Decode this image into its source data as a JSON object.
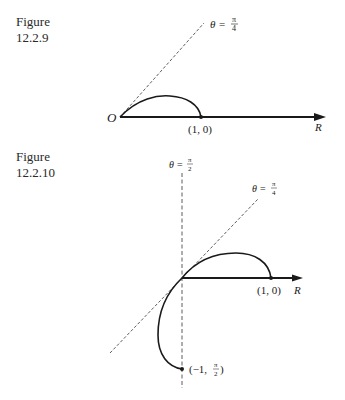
{
  "figures": [
    {
      "caption_word": "Figure",
      "caption_number": "12.2.9",
      "origin_label": "O",
      "axis_label": "R",
      "point_label": "(1, 0)",
      "ray_label": {
        "theta": "θ",
        "eq": "=",
        "num": "π",
        "den": "4"
      }
    },
    {
      "caption_word": "Figure",
      "caption_number": "12.2.10",
      "axis_label": "R",
      "point_label": "(1, 0)",
      "vertical_label": {
        "theta": "θ",
        "eq": "=",
        "num": "π",
        "den": "2"
      },
      "ray_label": {
        "theta": "θ",
        "eq": "=",
        "num": "π",
        "den": "4"
      },
      "end_point_label": {
        "prefix": "(−1, ",
        "num": "π",
        "den": "2",
        "suffix": ")"
      }
    }
  ],
  "colors": {
    "ink": "#1a1a1a",
    "background": "#ffffff"
  }
}
